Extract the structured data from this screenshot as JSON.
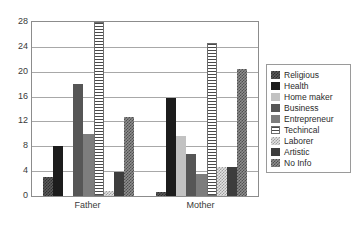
{
  "chart_data": {
    "type": "bar",
    "title": "",
    "subtitle": "",
    "xlabel": "",
    "ylabel": "",
    "categories": [
      "Father",
      "Mother"
    ],
    "ylim": [
      0,
      28
    ],
    "yticks": [
      0,
      4,
      8,
      12,
      16,
      20,
      24,
      28
    ],
    "ytick_labels": [
      "0",
      "4",
      "8",
      "12",
      "16",
      "20",
      "24",
      "28"
    ],
    "grid": true,
    "legend_position": "right",
    "series": [
      {
        "name": "Religious",
        "values": [
          3.0,
          0.7
        ],
        "color": "#5b5b5b",
        "pattern": "checker-dark"
      },
      {
        "name": "Health",
        "values": [
          8.0,
          15.8
        ],
        "color": "#1c1c1c",
        "pattern": "solid-black"
      },
      {
        "name": "Home maker",
        "values": [
          0.0,
          9.7
        ],
        "color": "#c2c2c2",
        "pattern": "solid-light"
      },
      {
        "name": "Business",
        "values": [
          18.0,
          6.7
        ],
        "color": "#565656",
        "pattern": "solid-dark-gray"
      },
      {
        "name": "Entrepreneur",
        "values": [
          10.0,
          3.6
        ],
        "color": "#7d7d7d",
        "pattern": "solid-mid-gray"
      },
      {
        "name": "Techincal",
        "values": [
          28.0,
          24.6
        ],
        "color": "#4a4a4a",
        "pattern": "horizontal-stripes"
      },
      {
        "name": "Laborer",
        "values": [
          0.8,
          4.6
        ],
        "color": "#e3e3e3",
        "pattern": "checker-light"
      },
      {
        "name": "Artistic",
        "values": [
          3.8,
          4.6
        ],
        "color": "#3d3d3d",
        "pattern": "solid-very-dark"
      },
      {
        "name": "No Info",
        "values": [
          12.7,
          20.5
        ],
        "color": "#8e8e8e",
        "pattern": "crosshatch"
      }
    ]
  },
  "legend": {
    "items": [
      {
        "label": "Religious"
      },
      {
        "label": "Health"
      },
      {
        "label": "Home maker"
      },
      {
        "label": "Business"
      },
      {
        "label": "Entrepreneur"
      },
      {
        "label": "Techincal"
      },
      {
        "label": "Laborer"
      },
      {
        "label": "Artistic"
      },
      {
        "label": "No Info"
      }
    ]
  },
  "colors": {
    "axis": "#8c8c8c",
    "grid": "#a8a8a8",
    "text": "#3a3a3a",
    "background": "#ffffff"
  }
}
